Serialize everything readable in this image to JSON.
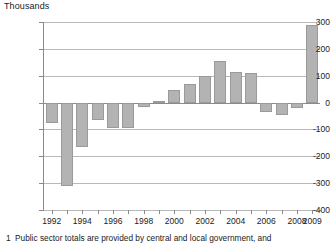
{
  "chart_data": {
    "type": "bar",
    "title": "",
    "unit_label": "Thousands",
    "xlabel": "",
    "ylabel": "Thousands",
    "ylim": [
      -400,
      300
    ],
    "ytick_values": [
      300,
      200,
      100,
      0,
      -100,
      -200,
      -300,
      -400
    ],
    "ytick_labels": [
      "300",
      "200",
      "100",
      "0",
      "-100",
      "-200",
      "-300",
      "-400"
    ],
    "grid": true,
    "legend": "none",
    "bar_color": "#b3b3b3",
    "categories": [
      "1992",
      "1993",
      "1994",
      "1995",
      "1996",
      "1997",
      "1998",
      "1999",
      "2000",
      "2001",
      "2002",
      "2003",
      "2004",
      "2005",
      "2006",
      "2007",
      "2008",
      "2009"
    ],
    "values": [
      -75,
      -310,
      -165,
      -65,
      -95,
      -93,
      -18,
      5,
      45,
      70,
      100,
      155,
      115,
      110,
      -35,
      -48,
      -20,
      290
    ],
    "xtick_labels": [
      "1992",
      "1994",
      "1996",
      "1998",
      "2000",
      "2002",
      "2004",
      "2006",
      "2008",
      "2009"
    ],
    "xtick_categories": [
      "1992",
      "1994",
      "1996",
      "1998",
      "2000",
      "2002",
      "2004",
      "2006",
      "2008",
      "2009"
    ]
  },
  "footnote": {
    "number": "1",
    "text": "Public sector totals are provided by central and local government, and"
  }
}
